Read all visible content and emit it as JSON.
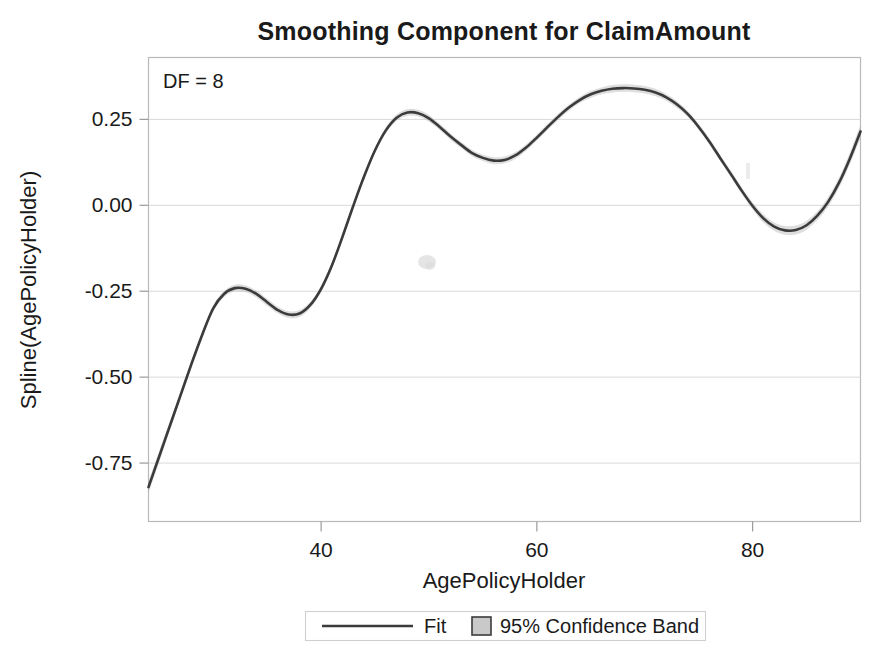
{
  "chart_data": {
    "type": "line",
    "title": "Smoothing Component for ClaimAmount",
    "xlabel": "AgePolicyHolder",
    "ylabel": "Spline(AgePolicyHolder)",
    "annotation": "DF = 8",
    "xlim": [
      24,
      90
    ],
    "ylim": [
      -0.92,
      0.43
    ],
    "xticks": [
      40,
      60,
      80
    ],
    "xtick_labels": [
      "40",
      "60",
      "80"
    ],
    "yticks": [
      0.25,
      0.0,
      -0.25,
      -0.5,
      -0.75
    ],
    "ytick_labels": [
      "0.25",
      "0.00",
      "-0.25",
      "-0.50",
      "-0.75"
    ],
    "grid": true,
    "zero_line": 0.0,
    "legend_position": "bottom",
    "line_color": "#3b3b3b",
    "band_color": "#b0b0b0",
    "series": [
      {
        "name": "Fit",
        "x": [
          24,
          25,
          26,
          27,
          28,
          29,
          30,
          31,
          32,
          33,
          34,
          35,
          36,
          37,
          38,
          39,
          40,
          41,
          42,
          43,
          44,
          45,
          46,
          47,
          48,
          49,
          50,
          51,
          52,
          53,
          54,
          55,
          56,
          57,
          58,
          59,
          60,
          61,
          62,
          63,
          64,
          65,
          66,
          67,
          68,
          69,
          70,
          71,
          72,
          73,
          74,
          75,
          76,
          77,
          78,
          79,
          80,
          81,
          82,
          83,
          84,
          85,
          86,
          87,
          88,
          89,
          90
        ],
        "values": [
          -0.82,
          -0.73,
          -0.64,
          -0.55,
          -0.46,
          -0.375,
          -0.3,
          -0.258,
          -0.241,
          -0.243,
          -0.258,
          -0.282,
          -0.305,
          -0.318,
          -0.315,
          -0.29,
          -0.243,
          -0.175,
          -0.09,
          0.0,
          0.085,
          0.16,
          0.218,
          0.255,
          0.27,
          0.268,
          0.253,
          0.228,
          0.2,
          0.175,
          0.152,
          0.138,
          0.13,
          0.132,
          0.145,
          0.168,
          0.197,
          0.228,
          0.258,
          0.285,
          0.307,
          0.323,
          0.333,
          0.339,
          0.341,
          0.34,
          0.336,
          0.328,
          0.314,
          0.293,
          0.265,
          0.228,
          0.185,
          0.137,
          0.09,
          0.042,
          -0.002,
          -0.038,
          -0.062,
          -0.073,
          -0.072,
          -0.058,
          -0.03,
          0.01,
          0.065,
          0.135,
          0.215
        ]
      }
    ],
    "confidence_band": {
      "name": "95% Confidence Band",
      "level": "95%",
      "half_width": [
        0.018,
        0.016,
        0.013,
        0.011,
        0.01,
        0.009,
        0.009,
        0.009,
        0.01,
        0.01,
        0.01,
        0.01,
        0.01,
        0.01,
        0.01,
        0.009,
        0.009,
        0.008,
        0.008,
        0.008,
        0.008,
        0.008,
        0.009,
        0.009,
        0.01,
        0.01,
        0.01,
        0.009,
        0.009,
        0.009,
        0.009,
        0.009,
        0.01,
        0.01,
        0.01,
        0.009,
        0.009,
        0.009,
        0.009,
        0.009,
        0.009,
        0.01,
        0.01,
        0.011,
        0.011,
        0.011,
        0.011,
        0.011,
        0.01,
        0.01,
        0.009,
        0.009,
        0.009,
        0.009,
        0.01,
        0.01,
        0.011,
        0.012,
        0.012,
        0.013,
        0.013,
        0.013,
        0.013,
        0.014,
        0.015,
        0.017,
        0.02
      ]
    },
    "legend_entries": [
      {
        "label": "Fit",
        "marker": "line"
      },
      {
        "label": "95% Confidence Band",
        "marker": "square"
      }
    ]
  }
}
